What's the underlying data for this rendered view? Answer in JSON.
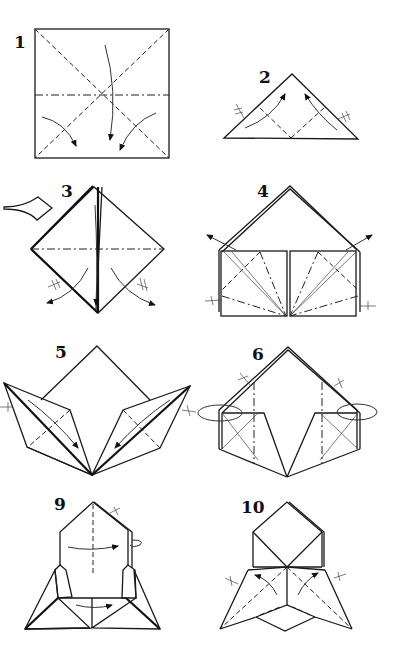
{
  "diagram": {
    "type": "origami folding instructions",
    "steps": [
      {
        "label": "1",
        "description": "Square with diagonal valley folds and horizontal mountain fold; arrows show collapse"
      },
      {
        "label": "2",
        "description": "Triangle base; fold corners up along dashed lines"
      },
      {
        "label": "3",
        "description": "Square base (diamond); view arrow from left; fold flaps outward"
      },
      {
        "label": "4",
        "description": "House shape with fanned crease lines; arrows pointing out"
      },
      {
        "label": "5",
        "description": "Spread flaps on both sides with fold arrows"
      },
      {
        "label": "6",
        "description": "Pentagon shape with mountain folds; turn-over arrows"
      },
      {
        "label": "9",
        "description": "Rocket-like form; fold arrows across"
      },
      {
        "label": "10",
        "description": "Final form with valley folds and arrows"
      }
    ],
    "symbols": {
      "valley_fold": "dashed line",
      "mountain_fold": "dash-dot line",
      "fold_arrow": "curved arrow",
      "repeat_mark": "crossed tick"
    }
  }
}
